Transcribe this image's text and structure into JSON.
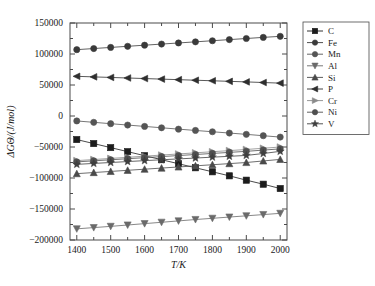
{
  "chart_data": {
    "type": "line",
    "title": "",
    "xlabel": "T/K",
    "ylabel": "ΔGΘ/(J/mol)",
    "xlim": [
      1380,
      2020
    ],
    "ylim": [
      -200000,
      150000
    ],
    "xticks": [
      1400,
      1500,
      1600,
      1700,
      1800,
      1900,
      2000
    ],
    "yticks": [
      -200000,
      -150000,
      -100000,
      -50000,
      0,
      50000,
      100000,
      150000
    ],
    "xtick_labels": [
      "1400",
      "1500",
      "1600",
      "1700",
      "1800",
      "1900",
      "2000"
    ],
    "ytick_labels": [
      "-200000",
      "-150000",
      "-100000",
      "-50000",
      "0",
      "50000",
      "100000",
      "150000"
    ],
    "minor_xticks": [
      1450,
      1550,
      1650,
      1750,
      1850,
      1950
    ],
    "grid": false,
    "legend_position": "right-outside",
    "x": [
      1400,
      1450,
      1500,
      1550,
      1600,
      1650,
      1700,
      1750,
      1800,
      1850,
      1900,
      1950,
      2000
    ],
    "series": [
      {
        "name": "C",
        "marker": "square",
        "color": "#1c1c1c",
        "values": [
          -38000,
          -44500,
          -51000,
          -57500,
          -64000,
          -70500,
          -77000,
          -83500,
          -90000,
          -96500,
          -103500,
          -110000,
          -117000
        ]
      },
      {
        "name": "Fe",
        "marker": "circle",
        "color": "#3a3a3a",
        "values": [
          107000,
          108800,
          110600,
          112400,
          114200,
          116000,
          117800,
          119600,
          121400,
          123200,
          125000,
          126800,
          128500
        ]
      },
      {
        "name": "Mn",
        "marker": "circle",
        "color": "#555555",
        "values": [
          -8000,
          -10200,
          -12400,
          -14600,
          -16800,
          -19000,
          -21200,
          -23300,
          -25400,
          -27500,
          -29600,
          -31800,
          -34000
        ]
      },
      {
        "name": "Al",
        "marker": "triangle-down",
        "color": "#6a6a6a",
        "values": [
          -182000,
          -180000,
          -178000,
          -175800,
          -173600,
          -171400,
          -169200,
          -167000,
          -165000,
          -163000,
          -161000,
          -159000,
          -157000
        ]
      },
      {
        "name": "Si",
        "marker": "triangle-up",
        "color": "#4a4a4a",
        "values": [
          -93000,
          -91200,
          -89400,
          -87600,
          -85800,
          -84000,
          -82200,
          -80400,
          -78600,
          -76800,
          -75000,
          -72500,
          -70000
        ]
      },
      {
        "name": "P",
        "marker": "triangle-left",
        "color": "#2e2e2e",
        "values": [
          64000,
          63100,
          62200,
          61300,
          60400,
          59500,
          58600,
          57700,
          56800,
          55900,
          55000,
          54000,
          53000
        ]
      },
      {
        "name": "Cr",
        "marker": "triangle-right",
        "color": "#8a8a8a",
        "values": [
          -72000,
          -70200,
          -68400,
          -66600,
          -64800,
          -63000,
          -61200,
          -59400,
          -57600,
          -55800,
          -54000,
          -52000,
          -50000
        ]
      },
      {
        "name": "Ni",
        "marker": "circle",
        "color": "#4f4f4f",
        "values": [
          -74000,
          -72300,
          -70600,
          -68900,
          -67200,
          -65500,
          -63800,
          -62100,
          -60400,
          -58700,
          -57000,
          -55000,
          -53000
        ]
      },
      {
        "name": "V",
        "marker": "star",
        "color": "#3f3f3f",
        "values": [
          -78000,
          -76500,
          -75000,
          -73500,
          -72000,
          -70600,
          -69200,
          -67800,
          -66400,
          -65000,
          -63600,
          -60500,
          -57000
        ]
      }
    ]
  },
  "legend": {
    "entries": [
      "C",
      "Fe",
      "Mn",
      "Al",
      "Si",
      "P",
      "Cr",
      "Ni",
      "V"
    ]
  }
}
